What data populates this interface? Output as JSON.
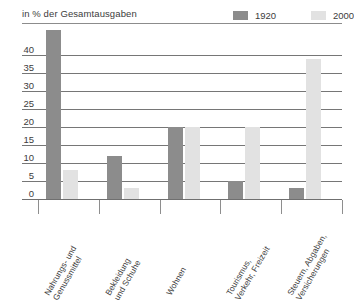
{
  "chart_data": {
    "type": "bar",
    "title": "",
    "subtitle": "in % der Gesamtausgaben",
    "xlabel": "",
    "ylabel": "",
    "ylim": [
      0,
      45
    ],
    "grid": true,
    "legend_position": "top-right",
    "categories": [
      "Nahrungs- und Genussmittel",
      "Bekleidung und Schuhe",
      "Wohnen",
      "Tourismus, Verkehr, Freizeit",
      "Steuern, Abgaben, Versicherungen"
    ],
    "category_lines": [
      [
        "Nahrungs- und",
        "Genussmittel"
      ],
      [
        "Bekleidung",
        "und Schuhe"
      ],
      [
        "Wohnen",
        ""
      ],
      [
        "Tourismus,",
        "Verkehr, Freizeit"
      ],
      [
        "Steuern, Abgaben,",
        "Versicherungen"
      ]
    ],
    "series": [
      {
        "name": "1920",
        "color": "#8c8c8c",
        "values": [
          47,
          12,
          20,
          5,
          3
        ]
      },
      {
        "name": "2000",
        "color": "#e2e2e2",
        "values": [
          8,
          3,
          20,
          20,
          39
        ]
      }
    ],
    "yticks": [
      0,
      5,
      10,
      15,
      20,
      25,
      30,
      35,
      40
    ],
    "ytick_labels": [
      "0",
      "5",
      "10",
      "15",
      "20",
      "25",
      "30",
      "35",
      "40"
    ]
  },
  "legend": {
    "entries": [
      {
        "label": "1920",
        "color": "#8c8c8c"
      },
      {
        "label": "2000",
        "color": "#e2e2e2"
      }
    ]
  },
  "colors": {
    "series_1920": "#8c8c8c",
    "series_2000": "#e2e2e2",
    "gridline": "#767676",
    "axis": "#6f6f6f",
    "text": "#3c3c3c",
    "background": "#ffffff"
  }
}
